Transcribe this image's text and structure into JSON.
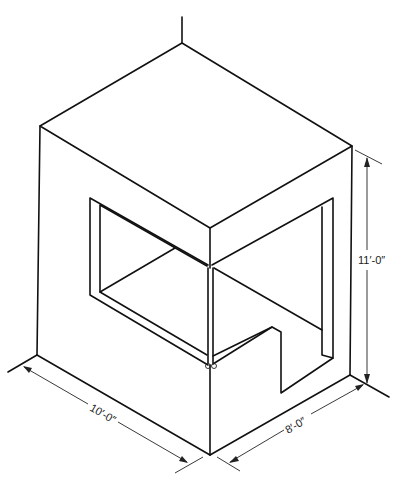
{
  "figure": {
    "type": "isometric-drawing",
    "colors": {
      "line": "#111111",
      "background": "#ffffff"
    },
    "dimensions": {
      "height": "11′-0″",
      "width_left": "10′-0″",
      "width_right": "8′-0″"
    }
  }
}
